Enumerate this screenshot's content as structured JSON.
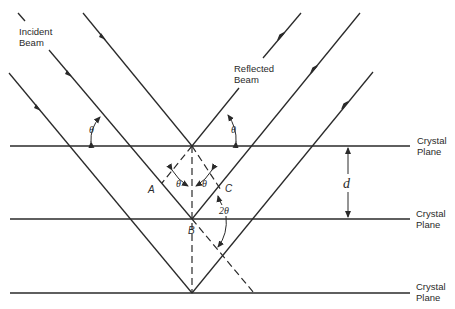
{
  "diagram": {
    "labels": {
      "incident_line1": "Incident",
      "incident_line2": "Beam",
      "reflected_line1": "Reflected",
      "reflected_line2": "Beam",
      "plane_word1": "Crystal",
      "plane_word2": "Plane",
      "theta": "θ",
      "two_theta": "2θ",
      "spacing": "d",
      "point_a": "A",
      "point_b": "B",
      "point_c": "C"
    },
    "planes": [
      {
        "label_line1": "Crystal",
        "label_line2": "Plane",
        "y": 146
      },
      {
        "label_line1": "Crystal",
        "label_line2": "Plane",
        "y": 219
      },
      {
        "label_line1": "Crystal",
        "label_line2": "Plane",
        "y": 293
      }
    ],
    "colors": {
      "stroke": "#2a2a2a",
      "background": "#ffffff"
    }
  }
}
